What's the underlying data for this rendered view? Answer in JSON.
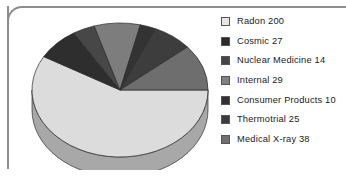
{
  "chart_data": {
    "type": "pie",
    "title": "",
    "subtitle": "",
    "xlabel": "",
    "ylabel": "",
    "total": 343,
    "legend_position": "right",
    "three_d": true,
    "grid": false,
    "categories": [
      "Radon",
      "Cosmic",
      "Nuclear Medicine",
      "Internal",
      "Consumer Products",
      "Thermotrial",
      "Medical X-ray"
    ],
    "values": [
      200,
      27,
      14,
      29,
      10,
      25,
      38
    ],
    "slices": [
      {
        "label": "Radon 200",
        "name": "Radon",
        "value": 200,
        "percent": 58.3,
        "color": "#dcdcdc",
        "side_color": "#a8a8a8"
      },
      {
        "label": "Cosmic 27",
        "name": "Cosmic",
        "value": 27,
        "percent": 7.9,
        "color": "#2e2e2e",
        "side_color": "#1e1e1e"
      },
      {
        "label": "Nuclear Medicine 14",
        "name": "Nuclear Medicine",
        "value": 14,
        "percent": 4.1,
        "color": "#474747",
        "side_color": "#303030"
      },
      {
        "label": "Internal 29",
        "name": "Internal",
        "value": 29,
        "percent": 8.5,
        "color": "#7d7d7d",
        "side_color": "#5a5a5a"
      },
      {
        "label": "Consumer Products 10",
        "name": "Consumer Products",
        "value": 10,
        "percent": 2.9,
        "color": "#333333",
        "side_color": "#222222"
      },
      {
        "label": "Thermotrial 25",
        "name": "Thermotrial",
        "value": 25,
        "percent": 7.3,
        "color": "#3d3d3d",
        "side_color": "#2a2a2a"
      },
      {
        "label": "Medical X-ray 38",
        "name": "Medical X-ray",
        "value": 38,
        "percent": 11.1,
        "color": "#6e6e6e",
        "side_color": "#4e4e4e"
      }
    ]
  },
  "legend": {
    "items": [
      {
        "label": "Radon 200",
        "color": "#e6e6e6"
      },
      {
        "label": "Cosmic 27",
        "color": "#2b2b2b"
      },
      {
        "label": "Nuclear Medicine 14",
        "color": "#454545"
      },
      {
        "label": "Internal 29",
        "color": "#808080"
      },
      {
        "label": "Consumer Products 10",
        "color": "#313131"
      },
      {
        "label": "Thermotrial 25",
        "color": "#3c3c3c"
      },
      {
        "label": "Medical X-ray 38",
        "color": "#6f6f6f"
      }
    ]
  }
}
